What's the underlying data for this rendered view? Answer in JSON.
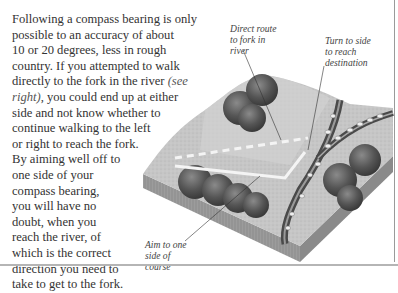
{
  "body_text": {
    "lines": [
      "Following a compass bearing is only",
      "possible to an accuracy of about",
      "10 or 20 degrees, less in rough",
      "country. If you attempted to walk",
      "directly to the fork in the river ",
      "right), you could end up at either",
      "side and not know whether to",
      "continue walking to the left",
      "or right to reach the fork.",
      "By aiming well off to",
      "one side of your",
      "compass bearing,",
      "you will have no",
      "doubt, when you",
      "reach the river, of",
      "which is the correct",
      "direction you need to",
      "take to get to the fork."
    ],
    "italic_see": "(see",
    "italic_right": "right)"
  },
  "illustration": {
    "description": "Isometric block diagram of terrain with trees, a forked river and dashed route lines",
    "captions": {
      "direct_route": [
        "Direct route",
        "to fork in",
        "river"
      ],
      "turn_to_side": [
        "Turn to side",
        "to reach",
        "destination"
      ],
      "aim_to_side": [
        "Aim to one",
        "side of",
        "course"
      ]
    },
    "colors": {
      "ground": "#c9c9c9",
      "ground_light": "#dcdcdc",
      "edge": "#8f8f8f",
      "trees": "#5a5a5a",
      "river": "#4a4a4a",
      "route_line": "#f2f2f2"
    }
  }
}
